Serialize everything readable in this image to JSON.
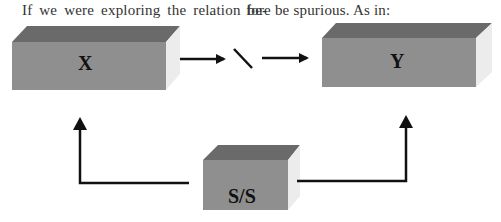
{
  "text": {
    "left_column_line": "If we were exploring the relation be-",
    "right_column_line": "fore be spurious. As in:"
  },
  "diagram": {
    "boxes": [
      {
        "id": "x",
        "label": "X"
      },
      {
        "id": "y",
        "label": "Y"
      },
      {
        "id": "ss",
        "label": "S/S"
      }
    ],
    "broken_link_glyph": "\\",
    "colors": {
      "front_face": "#8f8f8f",
      "top_face": "#6a6a6a",
      "side_face": "#ececec",
      "arrow": "#111111"
    }
  }
}
